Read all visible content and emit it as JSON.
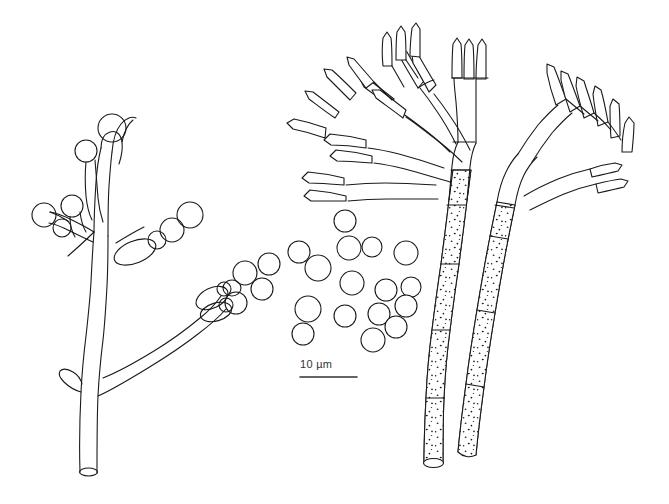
{
  "figure": {
    "domain_kind": "scientific-line-drawing",
    "background_color": "#ffffff",
    "ink_color": "#1a1a1a",
    "stroke_width": 1.1
  },
  "scale_bar": {
    "label": "10 µm",
    "value": 10,
    "unit": "µm",
    "bar_x1": 300,
    "bar_x2": 357,
    "bar_y": 377,
    "label_x": 300,
    "label_y": 358,
    "color": "#333333"
  },
  "panels": [
    {
      "name": "left-conidiophore",
      "description": "smooth-walled branched conidiophore with elongate phialides bearing globose conidia",
      "wall_texture": "smooth",
      "bounds": [
        40,
        100,
        260,
        480
      ]
    },
    {
      "name": "center-conidia",
      "description": "detached globose conidia",
      "count": 18,
      "bounds": [
        258,
        205,
        420,
        335
      ]
    },
    {
      "name": "middle-penicillus",
      "description": "verrucose stipe bearing a penicillate head of metulae and ampulliform phialides",
      "wall_texture": "verrucose",
      "bounds": [
        285,
        25,
        480,
        470
      ]
    },
    {
      "name": "right-penicillus",
      "description": "verrucose stipe with terminal verticil of phialides",
      "wall_texture": "verrucose",
      "bounds": [
        470,
        105,
        640,
        460
      ]
    }
  ],
  "conidia": [
    {
      "cx": 345,
      "cy": 221,
      "r": 11
    },
    {
      "cx": 269,
      "cy": 264,
      "r": 11
    },
    {
      "cx": 299,
      "cy": 252,
      "r": 11
    },
    {
      "cx": 318,
      "cy": 268,
      "r": 13
    },
    {
      "cx": 349,
      "cy": 248,
      "r": 12
    },
    {
      "cx": 372,
      "cy": 247,
      "r": 10
    },
    {
      "cx": 406,
      "cy": 253,
      "r": 12
    },
    {
      "cx": 386,
      "cy": 290,
      "r": 11
    },
    {
      "cx": 411,
      "cy": 287,
      "r": 10
    },
    {
      "cx": 352,
      "cy": 283,
      "r": 12
    },
    {
      "cx": 262,
      "cy": 289,
      "r": 11
    },
    {
      "cx": 308,
      "cy": 309,
      "r": 13
    },
    {
      "cx": 345,
      "cy": 316,
      "r": 11
    },
    {
      "cx": 379,
      "cy": 314,
      "r": 11
    },
    {
      "cx": 406,
      "cy": 306,
      "r": 11
    },
    {
      "cx": 303,
      "cy": 334,
      "r": 11
    },
    {
      "cx": 373,
      "cy": 340,
      "r": 12
    },
    {
      "cx": 396,
      "cy": 327,
      "r": 11
    }
  ],
  "left_structure": {
    "stalk_base": {
      "x": 88,
      "y": 472,
      "opening": "cut-end-ellipse"
    },
    "branch_count": 2,
    "phialide_count": 12,
    "terminal_conidia_count": 10
  },
  "middle_structure": {
    "stipe_base": {
      "x": 432,
      "y": 463,
      "opening": "cut-end-ellipse"
    },
    "septa_count": 3,
    "metulae_count": 5,
    "phialide_verticils": 5
  },
  "right_structure": {
    "stipe_base": {
      "x": 470,
      "y": 440,
      "opening": "rounded"
    },
    "septa_count": 2,
    "metulae_count": 2,
    "phialide_count": 7
  }
}
